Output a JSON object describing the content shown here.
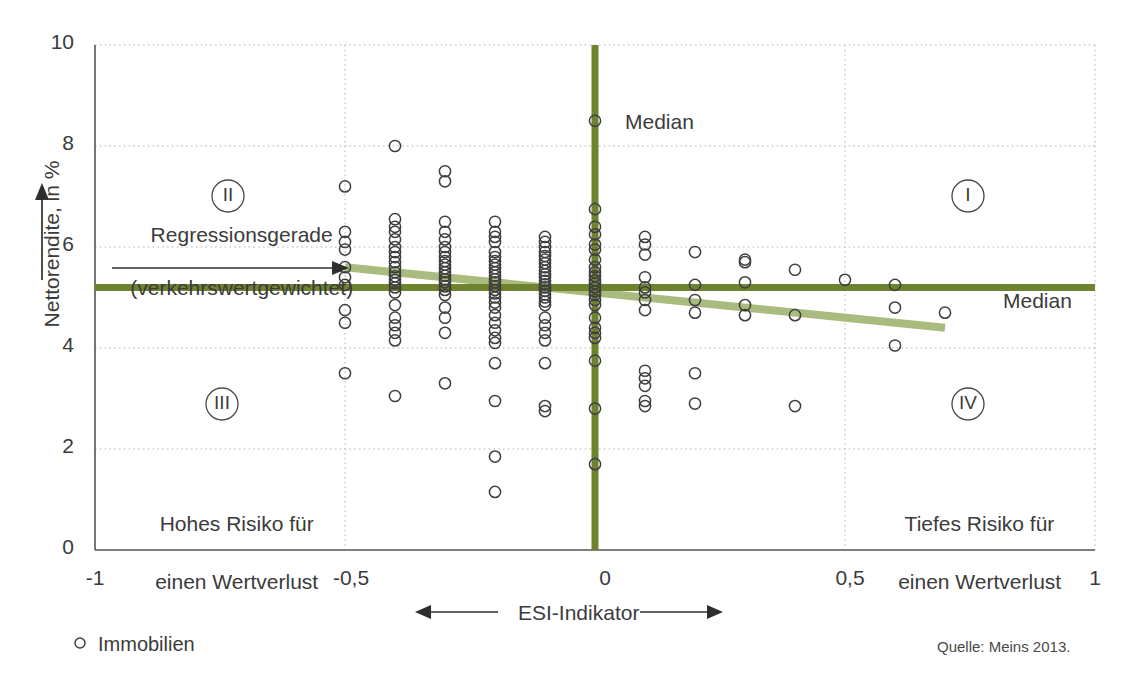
{
  "chart_data": {
    "type": "scatter",
    "title": "",
    "xlabel": "ESI-Indikator",
    "ylabel": "Nettorendite, in %",
    "xlim": [
      -1,
      1
    ],
    "ylim": [
      0,
      10
    ],
    "grid": true,
    "x_ticks": [
      "-1",
      "-0,5",
      "0",
      "0,5",
      "1"
    ],
    "x_tick_values": [
      -1,
      -0.5,
      0,
      0.5,
      1
    ],
    "y_ticks": [
      "0",
      "2",
      "4",
      "6",
      "8",
      "10"
    ],
    "y_tick_values": [
      0,
      2,
      4,
      6,
      8,
      10
    ],
    "series": [
      {
        "name": "Immobilien",
        "marker": "open-circle",
        "points": [
          [
            -0.5,
            7.2
          ],
          [
            -0.5,
            6.3
          ],
          [
            -0.5,
            6.1
          ],
          [
            -0.5,
            5.95
          ],
          [
            -0.5,
            5.6
          ],
          [
            -0.5,
            5.4
          ],
          [
            -0.5,
            5.25
          ],
          [
            -0.5,
            4.75
          ],
          [
            -0.5,
            4.5
          ],
          [
            -0.5,
            3.5
          ],
          [
            -0.4,
            8.0
          ],
          [
            -0.4,
            6.55
          ],
          [
            -0.4,
            6.4
          ],
          [
            -0.4,
            6.3
          ],
          [
            -0.4,
            6.15
          ],
          [
            -0.4,
            6.0
          ],
          [
            -0.4,
            5.9
          ],
          [
            -0.4,
            5.8
          ],
          [
            -0.4,
            5.7
          ],
          [
            -0.4,
            5.6
          ],
          [
            -0.4,
            5.5
          ],
          [
            -0.4,
            5.42
          ],
          [
            -0.4,
            5.35
          ],
          [
            -0.4,
            5.28
          ],
          [
            -0.4,
            5.2
          ],
          [
            -0.4,
            5.1
          ],
          [
            -0.4,
            4.85
          ],
          [
            -0.4,
            4.6
          ],
          [
            -0.4,
            4.45
          ],
          [
            -0.4,
            4.3
          ],
          [
            -0.4,
            4.15
          ],
          [
            -0.4,
            3.05
          ],
          [
            -0.3,
            7.5
          ],
          [
            -0.3,
            7.3
          ],
          [
            -0.3,
            6.5
          ],
          [
            -0.3,
            6.3
          ],
          [
            -0.3,
            6.15
          ],
          [
            -0.3,
            6.0
          ],
          [
            -0.3,
            5.9
          ],
          [
            -0.3,
            5.8
          ],
          [
            -0.3,
            5.72
          ],
          [
            -0.3,
            5.65
          ],
          [
            -0.3,
            5.58
          ],
          [
            -0.3,
            5.5
          ],
          [
            -0.3,
            5.43
          ],
          [
            -0.3,
            5.36
          ],
          [
            -0.3,
            5.3
          ],
          [
            -0.3,
            5.22
          ],
          [
            -0.3,
            5.15
          ],
          [
            -0.3,
            5.05
          ],
          [
            -0.3,
            4.8
          ],
          [
            -0.3,
            4.6
          ],
          [
            -0.3,
            4.3
          ],
          [
            -0.3,
            3.3
          ],
          [
            -0.2,
            6.5
          ],
          [
            -0.2,
            6.3
          ],
          [
            -0.2,
            6.2
          ],
          [
            -0.2,
            6.1
          ],
          [
            -0.2,
            5.9
          ],
          [
            -0.2,
            5.8
          ],
          [
            -0.2,
            5.72
          ],
          [
            -0.2,
            5.65
          ],
          [
            -0.2,
            5.58
          ],
          [
            -0.2,
            5.5
          ],
          [
            -0.2,
            5.43
          ],
          [
            -0.2,
            5.36
          ],
          [
            -0.2,
            5.3
          ],
          [
            -0.2,
            5.22
          ],
          [
            -0.2,
            5.15
          ],
          [
            -0.2,
            5.08
          ],
          [
            -0.2,
            5.0
          ],
          [
            -0.2,
            4.9
          ],
          [
            -0.2,
            4.8
          ],
          [
            -0.2,
            4.65
          ],
          [
            -0.2,
            4.5
          ],
          [
            -0.2,
            4.35
          ],
          [
            -0.2,
            4.2
          ],
          [
            -0.2,
            4.1
          ],
          [
            -0.2,
            3.7
          ],
          [
            -0.2,
            2.95
          ],
          [
            -0.2,
            1.85
          ],
          [
            -0.2,
            1.15
          ],
          [
            -0.1,
            6.2
          ],
          [
            -0.1,
            6.1
          ],
          [
            -0.1,
            6.0
          ],
          [
            -0.1,
            5.9
          ],
          [
            -0.1,
            5.82
          ],
          [
            -0.1,
            5.75
          ],
          [
            -0.1,
            5.68
          ],
          [
            -0.1,
            5.6
          ],
          [
            -0.1,
            5.53
          ],
          [
            -0.1,
            5.46
          ],
          [
            -0.1,
            5.4
          ],
          [
            -0.1,
            5.33
          ],
          [
            -0.1,
            5.26
          ],
          [
            -0.1,
            5.2
          ],
          [
            -0.1,
            5.13
          ],
          [
            -0.1,
            5.06
          ],
          [
            -0.1,
            5.0
          ],
          [
            -0.1,
            4.92
          ],
          [
            -0.1,
            4.85
          ],
          [
            -0.1,
            4.6
          ],
          [
            -0.1,
            4.45
          ],
          [
            -0.1,
            4.3
          ],
          [
            -0.1,
            4.15
          ],
          [
            -0.1,
            3.7
          ],
          [
            -0.1,
            2.85
          ],
          [
            -0.1,
            2.75
          ],
          [
            0,
            8.5
          ],
          [
            0,
            6.75
          ],
          [
            0,
            6.4
          ],
          [
            0,
            6.25
          ],
          [
            0,
            6.05
          ],
          [
            0,
            5.95
          ],
          [
            0,
            5.75
          ],
          [
            0,
            5.6
          ],
          [
            0,
            5.5
          ],
          [
            0,
            5.42
          ],
          [
            0,
            5.34
          ],
          [
            0,
            5.28
          ],
          [
            0,
            5.2
          ],
          [
            0,
            5.12
          ],
          [
            0,
            5.05
          ],
          [
            0,
            4.95
          ],
          [
            0,
            4.85
          ],
          [
            0,
            4.6
          ],
          [
            0,
            4.4
          ],
          [
            0,
            4.3
          ],
          [
            0,
            4.2
          ],
          [
            0,
            3.75
          ],
          [
            0,
            2.8
          ],
          [
            0,
            1.7
          ],
          [
            0.1,
            6.2
          ],
          [
            0.1,
            6.05
          ],
          [
            0.1,
            5.85
          ],
          [
            0.1,
            5.4
          ],
          [
            0.1,
            5.2
          ],
          [
            0.1,
            5.1
          ],
          [
            0.1,
            4.95
          ],
          [
            0.1,
            4.75
          ],
          [
            0.1,
            3.55
          ],
          [
            0.1,
            3.4
          ],
          [
            0.1,
            3.25
          ],
          [
            0.1,
            2.95
          ],
          [
            0.1,
            2.85
          ],
          [
            0.2,
            5.9
          ],
          [
            0.2,
            5.25
          ],
          [
            0.2,
            4.95
          ],
          [
            0.2,
            4.7
          ],
          [
            0.2,
            3.5
          ],
          [
            0.2,
            2.9
          ],
          [
            0.3,
            5.75
          ],
          [
            0.3,
            5.7
          ],
          [
            0.3,
            5.3
          ],
          [
            0.3,
            4.85
          ],
          [
            0.3,
            4.65
          ],
          [
            0.4,
            5.55
          ],
          [
            0.4,
            4.65
          ],
          [
            0.4,
            2.85
          ],
          [
            0.5,
            5.35
          ],
          [
            0.6,
            5.25
          ],
          [
            0.6,
            4.8
          ],
          [
            0.6,
            4.05
          ],
          [
            0.7,
            4.7
          ]
        ]
      }
    ],
    "reference_lines": [
      {
        "name": "median-horizontal",
        "orientation": "horizontal",
        "value": 5.2,
        "label": "Median",
        "color": "#6e8230"
      },
      {
        "name": "median-vertical",
        "orientation": "vertical",
        "value": 0,
        "label": "Median",
        "color": "#6e8230"
      }
    ],
    "trend_line": {
      "name": "Regressionsgerade (verkehrswertgewichtet)",
      "color": "#a5b878",
      "x_start": -0.5,
      "y_start": 5.6,
      "x_end": 0.7,
      "y_end": 4.4
    },
    "quadrants": [
      {
        "id": "I",
        "label": "I"
      },
      {
        "id": "II",
        "label": "II"
      },
      {
        "id": "III",
        "label": "III"
      },
      {
        "id": "IV",
        "label": "IV"
      }
    ],
    "annotations": [
      {
        "name": "risk-high",
        "lines": [
          "Hohes Risiko für",
          "einen Wertverlust"
        ]
      },
      {
        "name": "risk-low",
        "lines": [
          "Tiefes Risiko für",
          "einen Wertverlust"
        ]
      },
      {
        "name": "regression",
        "lines": [
          "Regressionsgerade",
          "(verkehrswertgewichtet)"
        ]
      }
    ],
    "legend": {
      "position": "below-left",
      "entries": [
        {
          "label": "Immobilien",
          "marker": "open-circle"
        }
      ]
    },
    "source": "Quelle: Meins 2013."
  },
  "axes": {
    "y_title": "Nettorendite, in %",
    "x_title": "ESI-Indikator",
    "x_tick_labels": [
      "-1",
      "-0,5",
      "0",
      "0,5",
      "1"
    ],
    "y_tick_labels": [
      "10",
      "8",
      "6",
      "4",
      "2",
      "0"
    ]
  },
  "labels": {
    "median_top": "Median",
    "median_right": "Median",
    "quadrant_1": "I",
    "quadrant_2": "II",
    "quadrant_3": "III",
    "quadrant_4": "IV",
    "regression_line1": "Regressionsgerade",
    "regression_line2": "(verkehrswertgewichtet)",
    "risk_high_line1": "Hohes Risiko für",
    "risk_high_line2": "einen Wertverlust",
    "risk_low_line1": "Tiefes Risiko für",
    "risk_low_line2": "einen Wertverlust",
    "legend_item": "Immobilien",
    "source": "Quelle: Meins 2013."
  },
  "colors": {
    "median": "#6e8230",
    "trend": "#a5b878",
    "grid": "#b5b5b5",
    "axis": "#555555",
    "text": "#3b3b3b",
    "marker_stroke": "#3f3f3f"
  }
}
